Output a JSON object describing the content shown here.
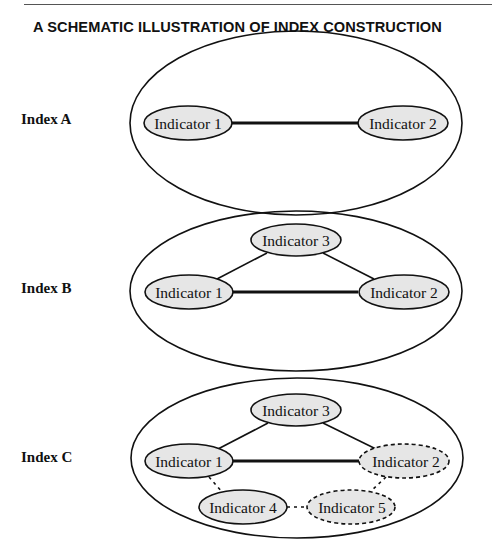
{
  "title": "A SCHEMATIC ILLUSTRATION OF INDEX CONSTRUCTION",
  "colors": {
    "node_fill": "#e6e6e6",
    "stroke": "#111111",
    "background": "#ffffff"
  },
  "indexes": [
    {
      "label": "Index A",
      "nodes": [
        {
          "id": "1",
          "label": "Indicator 1",
          "style": "solid"
        },
        {
          "id": "2",
          "label": "Indicator 2",
          "style": "solid"
        }
      ],
      "edges": [
        {
          "from": "1",
          "to": "2",
          "style": "thick"
        }
      ]
    },
    {
      "label": "Index B",
      "nodes": [
        {
          "id": "1",
          "label": "Indicator 1",
          "style": "solid"
        },
        {
          "id": "2",
          "label": "Indicator 2",
          "style": "solid"
        },
        {
          "id": "3",
          "label": "Indicator 3",
          "style": "solid"
        }
      ],
      "edges": [
        {
          "from": "1",
          "to": "2",
          "style": "thick"
        },
        {
          "from": "1",
          "to": "3",
          "style": "thin"
        },
        {
          "from": "3",
          "to": "2",
          "style": "thin"
        }
      ]
    },
    {
      "label": "Index C",
      "nodes": [
        {
          "id": "1",
          "label": "Indicator 1",
          "style": "solid"
        },
        {
          "id": "2",
          "label": "Indicator 2",
          "style": "dashed"
        },
        {
          "id": "3",
          "label": "Indicator 3",
          "style": "solid"
        },
        {
          "id": "4",
          "label": "Indicator 4",
          "style": "solid"
        },
        {
          "id": "5",
          "label": "Indicator 5",
          "style": "dashed"
        }
      ],
      "edges": [
        {
          "from": "1",
          "to": "2",
          "style": "thick"
        },
        {
          "from": "1",
          "to": "3",
          "style": "thin"
        },
        {
          "from": "3",
          "to": "2",
          "style": "thin"
        },
        {
          "from": "1",
          "to": "4",
          "style": "dotted"
        },
        {
          "from": "4",
          "to": "5",
          "style": "dotted"
        },
        {
          "from": "5",
          "to": "2",
          "style": "dotted"
        }
      ]
    }
  ]
}
